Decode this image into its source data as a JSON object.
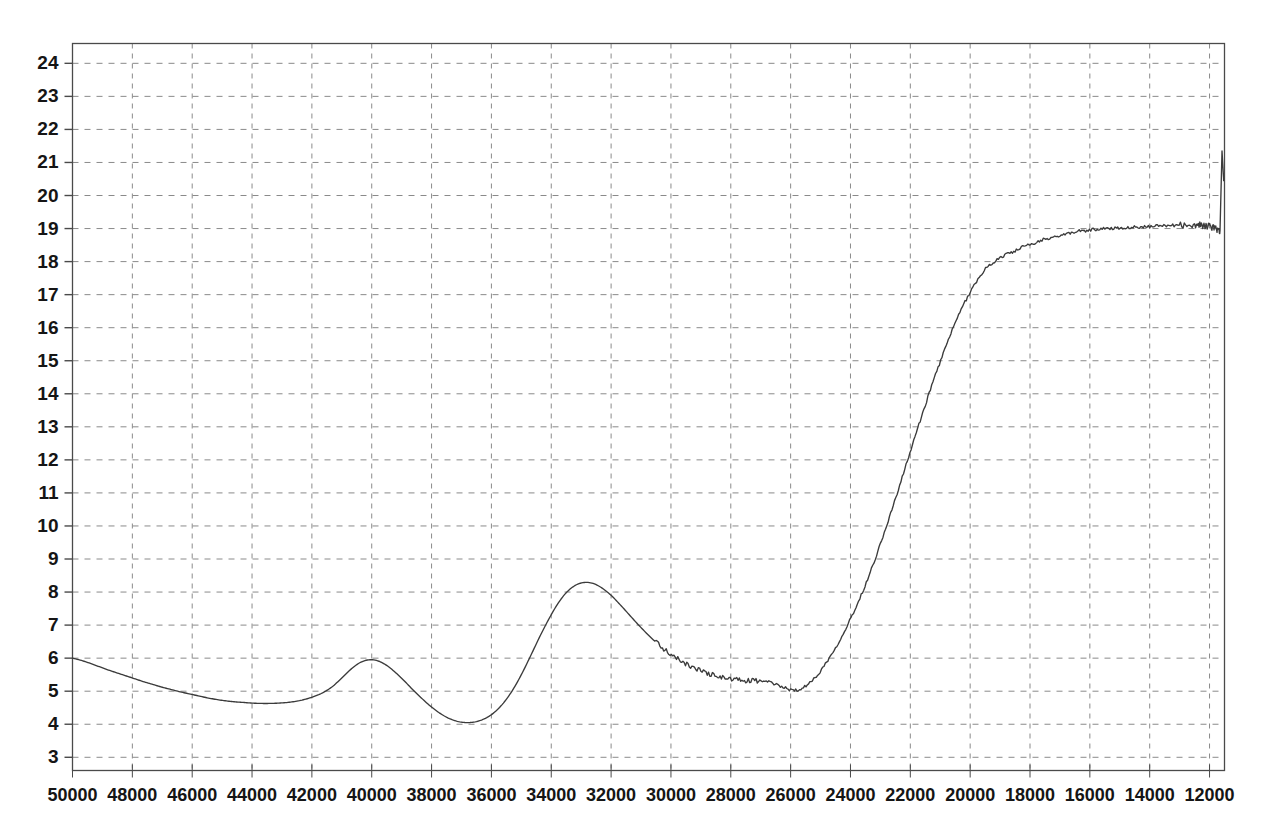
{
  "chart_data": {
    "type": "line",
    "title": "",
    "subtitle": "",
    "xlabel": "",
    "ylabel": "",
    "xlim": [
      50000,
      11500
    ],
    "ylim": [
      2.6,
      24.6
    ],
    "x_axis_reversed": true,
    "grid": true,
    "grid_style": "dashed",
    "legend": "none",
    "xticks": [
      50000,
      48000,
      46000,
      44000,
      42000,
      40000,
      38000,
      36000,
      34000,
      32000,
      30000,
      28000,
      26000,
      24000,
      22000,
      20000,
      18000,
      16000,
      14000,
      12000
    ],
    "xtick_labels": [
      "50000",
      "48000",
      "46000",
      "44000",
      "42000",
      "40000",
      "38000",
      "36000",
      "34000",
      "32000",
      "30000",
      "28000",
      "26000",
      "24000",
      "22000",
      "20000",
      "18000",
      "16000",
      "14000",
      "12000"
    ],
    "yticks": [
      3,
      4,
      5,
      6,
      7,
      8,
      9,
      10,
      11,
      12,
      13,
      14,
      15,
      16,
      17,
      18,
      19,
      20,
      21,
      22,
      23,
      24
    ],
    "ytick_labels": [
      "3",
      "4",
      "5",
      "6",
      "7",
      "8",
      "9",
      "10",
      "11",
      "12",
      "13",
      "14",
      "15",
      "16",
      "17",
      "18",
      "19",
      "20",
      "21",
      "22",
      "23",
      "24"
    ],
    "series": [
      {
        "name": "spectrum",
        "color": "#3b3b3b",
        "x": [
          50000,
          49700,
          49400,
          49100,
          48800,
          48500,
          48200,
          47900,
          47600,
          47300,
          47000,
          46700,
          46400,
          46100,
          45800,
          45500,
          45200,
          44900,
          44600,
          44300,
          44000,
          43700,
          43400,
          43100,
          42800,
          42500,
          42200,
          41900,
          41600,
          41300,
          41000,
          40700,
          40400,
          40100,
          39800,
          39500,
          39200,
          38900,
          38600,
          38300,
          38000,
          37700,
          37400,
          37100,
          36800,
          36500,
          36200,
          35900,
          35600,
          35300,
          35000,
          34700,
          34400,
          34100,
          33800,
          33500,
          33200,
          32900,
          32600,
          32300,
          32000,
          31700,
          31400,
          31100,
          30800,
          30500,
          30200,
          29900,
          29600,
          29300,
          29000,
          28700,
          28400,
          28100,
          27800,
          27500,
          27200,
          26900,
          26600,
          26300,
          26000,
          25700,
          25400,
          25100,
          24800,
          24500,
          24200,
          23900,
          23600,
          23300,
          23000,
          22700,
          22400,
          22100,
          21800,
          21500,
          21200,
          20900,
          20600,
          20300,
          20000,
          19700,
          19400,
          19100,
          18800,
          18500,
          18200,
          17900,
          17600,
          17300,
          17000,
          16700,
          16400,
          16100,
          15800,
          15500,
          15200,
          14900,
          14600,
          14300,
          14000,
          13700,
          13400,
          13100,
          12800,
          12500,
          12300,
          12150,
          12050,
          11950,
          11850,
          11750,
          11650
        ],
        "y": [
          6.0,
          5.93,
          5.84,
          5.74,
          5.64,
          5.55,
          5.46,
          5.37,
          5.28,
          5.2,
          5.12,
          5.05,
          4.98,
          4.92,
          4.86,
          4.8,
          4.75,
          4.71,
          4.68,
          4.66,
          4.64,
          4.63,
          4.63,
          4.64,
          4.66,
          4.7,
          4.76,
          4.85,
          4.97,
          5.15,
          5.4,
          5.66,
          5.86,
          5.95,
          5.92,
          5.78,
          5.56,
          5.3,
          5.02,
          4.76,
          4.52,
          4.32,
          4.17,
          4.08,
          4.05,
          4.08,
          4.18,
          4.36,
          4.64,
          5.02,
          5.5,
          6.05,
          6.62,
          7.15,
          7.62,
          7.98,
          8.2,
          8.29,
          8.26,
          8.12,
          7.9,
          7.62,
          7.32,
          7.02,
          6.74,
          6.48,
          6.25,
          6.05,
          5.88,
          5.74,
          5.62,
          5.52,
          5.44,
          5.38,
          5.34,
          5.32,
          5.32,
          5.3,
          5.24,
          5.14,
          5.04,
          5.06,
          5.22,
          5.5,
          5.88,
          6.32,
          6.82,
          7.38,
          8.0,
          8.7,
          9.46,
          10.26,
          11.1,
          11.96,
          12.82,
          13.66,
          14.46,
          15.22,
          15.92,
          16.54,
          17.08,
          17.52,
          17.86,
          18.05,
          18.22,
          18.32,
          18.46,
          18.52,
          18.66,
          18.7,
          18.8,
          18.84,
          18.92,
          18.94,
          18.98,
          19.0,
          19.01,
          19.03,
          19.04,
          19.05,
          19.06,
          19.08,
          19.09,
          19.1,
          19.11,
          19.11,
          19.1,
          19.09,
          19.07,
          19.05,
          19.02,
          18.98,
          18.94
        ],
        "y_note": "primary transmittance-like curve"
      }
    ],
    "annotations": [],
    "features": {
      "left_start_value": 6.0,
      "broad_minimum_near_45000": 4.63,
      "local_max_near_43100": 5.95,
      "deep_min_near_41000": 4.05,
      "strong_peak_near_38900": 8.29,
      "min_near_35100": 5.03,
      "steep_rise_34000_to_29000": true,
      "plateau_level": 19.0,
      "plateau_max_near_23300": 19.12,
      "plateau_dip_near_15600": 18.58,
      "final_peak_near_12300": 22.3,
      "terminal_drop_value": 20.45
    }
  },
  "axes": {
    "y_tick_labels": [
      "24",
      "23",
      "22",
      "21",
      "20",
      "19",
      "18",
      "17",
      "16",
      "15",
      "14",
      "13",
      "12",
      "11",
      "10",
      "9",
      "8",
      "7",
      "6",
      "5",
      "4",
      "3"
    ],
    "x_tick_labels": [
      "50000",
      "48000",
      "46000",
      "44000",
      "42000",
      "40000",
      "38000",
      "36000",
      "34000",
      "32000",
      "30000",
      "28000",
      "26000",
      "24000",
      "22000",
      "20000",
      "18000",
      "16000",
      "14000",
      "12000"
    ]
  },
  "style": {
    "background": "#ffffff",
    "curve_color": "#3b3b3b",
    "grid_color": "#8a8a8a",
    "border_color": "#4a4a4a",
    "label_color": "#151515"
  }
}
